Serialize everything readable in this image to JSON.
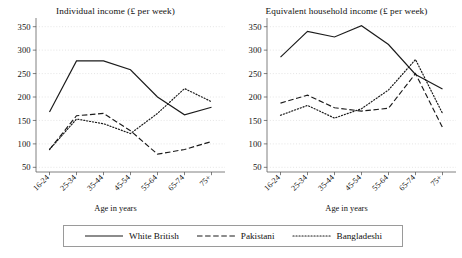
{
  "figure": {
    "xlabel": "Age in years",
    "legend_position": "bottom-center"
  },
  "legend": {
    "items": [
      {
        "label": "White British",
        "style": "solid"
      },
      {
        "label": "Pakistani",
        "style": "dashed"
      },
      {
        "label": "Bangladeshi",
        "style": "dotted"
      }
    ]
  },
  "chart_data": [
    {
      "type": "line",
      "panel": "left",
      "title": "Individual income (£ per week)",
      "xlabel": "Age in years",
      "ylabel": "",
      "categories": [
        "16-24",
        "25-34",
        "35-44",
        "45-54",
        "55-64",
        "65-74",
        "75+"
      ],
      "yticks": [
        50,
        100,
        150,
        200,
        250,
        300,
        350
      ],
      "ylim": [
        40,
        360
      ],
      "grid": true,
      "series": [
        {
          "name": "White British",
          "style": "solid",
          "values": [
            168,
            277,
            277,
            258,
            200,
            162,
            178
          ]
        },
        {
          "name": "Pakistani",
          "style": "dashed",
          "values": [
            88,
            160,
            165,
            128,
            78,
            88,
            105
          ]
        },
        {
          "name": "Bangladeshi",
          "style": "dotted",
          "values": [
            88,
            153,
            143,
            122,
            165,
            218,
            190
          ]
        }
      ]
    },
    {
      "type": "line",
      "panel": "right",
      "title": "Equivalent household income (£ per week)",
      "xlabel": "Age in years",
      "ylabel": "",
      "categories": [
        "16-24",
        "25-34",
        "35-44",
        "45-54",
        "55-64",
        "65-74",
        "75+"
      ],
      "yticks": [
        50,
        100,
        150,
        200,
        250,
        300,
        350
      ],
      "ylim": [
        40,
        360
      ],
      "grid": true,
      "series": [
        {
          "name": "White British",
          "style": "solid",
          "values": [
            285,
            340,
            328,
            352,
            312,
            248,
            217
          ]
        },
        {
          "name": "Pakistani",
          "style": "dashed",
          "values": [
            187,
            204,
            177,
            170,
            176,
            250,
            135
          ]
        },
        {
          "name": "Bangladeshi",
          "style": "dotted",
          "values": [
            161,
            182,
            155,
            175,
            215,
            280,
            165
          ]
        }
      ]
    }
  ]
}
